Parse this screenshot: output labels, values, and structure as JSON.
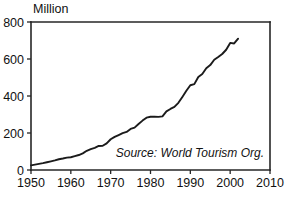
{
  "chart_data": {
    "type": "line",
    "title": "",
    "subtitle": "",
    "xlabel": "",
    "ylabel": "",
    "unit_label": "Million",
    "source_note": "Source: World Tourism Org.",
    "grid": false,
    "legend": false,
    "legend_position": "none",
    "xlim": [
      1950,
      2010
    ],
    "ylim": [
      0,
      800
    ],
    "xticks": [
      1950,
      1960,
      1970,
      1980,
      1990,
      2000,
      2010
    ],
    "xtick_labels": [
      "1950",
      "1960",
      "1970",
      "1980",
      "1990",
      "2000",
      "2010"
    ],
    "yticks": [
      0,
      200,
      400,
      600,
      800
    ],
    "ytick_labels": [
      "0",
      "200",
      "400",
      "600",
      "800"
    ],
    "series": [
      {
        "name": "International tourist arrivals",
        "x": [
          1950,
          1951,
          1952,
          1953,
          1954,
          1955,
          1956,
          1957,
          1958,
          1959,
          1960,
          1961,
          1962,
          1963,
          1964,
          1965,
          1966,
          1967,
          1968,
          1969,
          1970,
          1971,
          1972,
          1973,
          1974,
          1975,
          1976,
          1977,
          1978,
          1979,
          1980,
          1981,
          1982,
          1983,
          1984,
          1985,
          1986,
          1987,
          1988,
          1989,
          1990,
          1991,
          1992,
          1993,
          1994,
          1995,
          1996,
          1997,
          1998,
          1999,
          2000,
          2001,
          2002
        ],
        "values": [
          25,
          29,
          33,
          37,
          42,
          47,
          52,
          58,
          62,
          67,
          69,
          75,
          81,
          90,
          104,
          113,
          120,
          130,
          131,
          144,
          166,
          179,
          189,
          199,
          206,
          222,
          229,
          249,
          267,
          283,
          288,
          288,
          287,
          290,
          317,
          330,
          341,
          363,
          395,
          428,
          458,
          464,
          503,
          519,
          550,
          567,
          596,
          611,
          627,
          650,
          687,
          684,
          710
        ]
      }
    ]
  },
  "axes_geometry": {
    "plot_left_px": 31,
    "plot_right_px": 270,
    "plot_top_px": 22,
    "plot_bottom_px": 170
  },
  "colors": {
    "line": "#1b1b1b",
    "axis": "#262626",
    "text": "#111111",
    "background": "#ffffff"
  }
}
